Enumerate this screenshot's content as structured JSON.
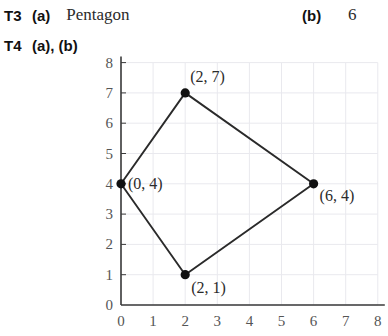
{
  "answers": [
    {
      "id": "t3",
      "question_label": "T3",
      "part_a_label": "(a)",
      "part_a_value": "Pentagon",
      "part_b_label": "(b)",
      "part_b_value": "6"
    },
    {
      "id": "t4",
      "question_label": "T4",
      "parts_label": "(a), (b)"
    }
  ],
  "chart_data": {
    "type": "scatter",
    "title": "",
    "xlabel": "",
    "ylabel": "",
    "xlim": [
      0,
      8
    ],
    "ylim": [
      0,
      8
    ],
    "grid": true,
    "legend": null,
    "x_ticks": [
      "0",
      "1",
      "2",
      "3",
      "4",
      "5",
      "6",
      "7",
      "8"
    ],
    "y_ticks": [
      "0",
      "1",
      "2",
      "3",
      "4",
      "5",
      "6",
      "7",
      "8"
    ],
    "points": [
      {
        "x": 0,
        "y": 4,
        "label": "(0, 4)",
        "label_dx": 7,
        "label_dy": 5
      },
      {
        "x": 2,
        "y": 7,
        "label": "(2, 7)",
        "label_dx": 5,
        "label_dy": -11
      },
      {
        "x": 6,
        "y": 4,
        "label": "(6, 4)",
        "label_dx": 6,
        "label_dy": 17
      },
      {
        "x": 2,
        "y": 1,
        "label": "(2, 1)",
        "label_dx": 6,
        "label_dy": 18
      }
    ],
    "polygon_order": [
      0,
      1,
      2,
      3
    ],
    "closed": true,
    "colors": {
      "axis": "#3a3a3a",
      "grid": "#e9e9ee",
      "line": "#2a2a2a",
      "marker": "#111111",
      "tick_text": "#555555",
      "label_text": "#2b2b2b"
    }
  }
}
